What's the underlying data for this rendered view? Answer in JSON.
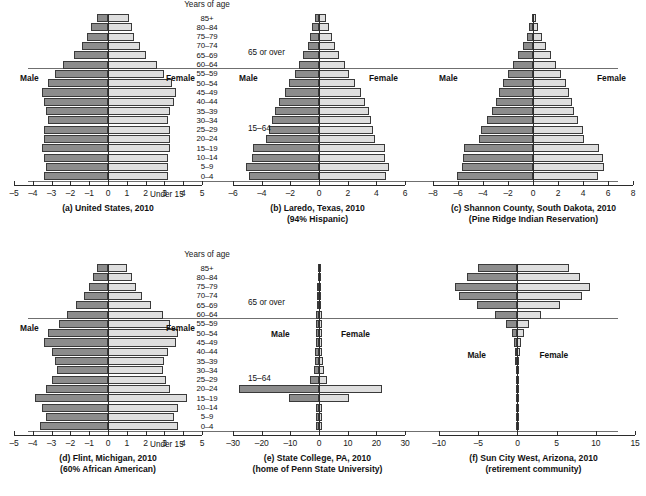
{
  "figure": {
    "age_axis_title": "Years of age",
    "age_groups": [
      "85+",
      "80–84",
      "75–79",
      "70–74",
      "65–69",
      "60–64",
      "55–59",
      "50–54",
      "45–49",
      "40–44",
      "35–39",
      "30–34",
      "25–29",
      "20–24",
      "15–19",
      "10–14",
      "5–9",
      "0–4"
    ],
    "annotations": {
      "over65": "65 or over",
      "working": "15–64",
      "under15": "Under 15",
      "male": "Male",
      "female": "Female"
    },
    "colors": {
      "male_bar": "#8c8c8c",
      "female_bar": "#dedede",
      "outline": "#3a3a3a",
      "rule": "#6f6f6f",
      "text": "#111111"
    }
  },
  "chart_data": [
    {
      "type": "bar",
      "id": "a",
      "title": "(a) United States, 2010",
      "subtitle": "",
      "xlabel": "",
      "ylabel": "Years of age",
      "xlim": [
        -5,
        5
      ],
      "xticks": [
        -5,
        -4,
        -3,
        -2,
        -1,
        0,
        1,
        2,
        3,
        4,
        5
      ],
      "xticklabels": [
        "–5",
        "–4",
        "–3",
        "–2",
        "–1",
        "0",
        "1",
        "2",
        "3",
        "4",
        "5"
      ],
      "categories": [
        "85+",
        "80–84",
        "75–79",
        "70–74",
        "65–69",
        "60–64",
        "55–59",
        "50–54",
        "45–49",
        "40–44",
        "35–39",
        "30–34",
        "25–29",
        "20–24",
        "15–19",
        "10–14",
        "5–9",
        "0–4"
      ],
      "series": [
        {
          "name": "Male",
          "values": [
            -0.6,
            -0.9,
            -1.1,
            -1.4,
            -1.8,
            -2.4,
            -2.8,
            -3.2,
            -3.5,
            -3.4,
            -3.3,
            -3.2,
            -3.4,
            -3.4,
            -3.5,
            -3.4,
            -3.3,
            -3.4
          ]
        },
        {
          "name": "Female",
          "values": [
            1.1,
            1.3,
            1.4,
            1.7,
            2.0,
            2.6,
            3.0,
            3.4,
            3.6,
            3.5,
            3.3,
            3.2,
            3.3,
            3.3,
            3.3,
            3.2,
            3.2,
            3.2
          ]
        }
      ],
      "grid": false,
      "legend": "none"
    },
    {
      "type": "bar",
      "id": "b",
      "title": "(b) Laredo, Texas, 2010",
      "subtitle": "(94% Hispanic)",
      "xlabel": "",
      "ylabel": "Years of age",
      "xlim": [
        -6,
        6
      ],
      "xticks": [
        -6,
        -4,
        -2,
        0,
        2,
        4,
        6
      ],
      "xticklabels": [
        "–6",
        "–4",
        "–2",
        "0",
        "2",
        "4",
        "6"
      ],
      "categories": [
        "85+",
        "80–84",
        "75–79",
        "70–74",
        "65–69",
        "60–64",
        "55–59",
        "50–54",
        "45–49",
        "40–44",
        "35–39",
        "30–34",
        "25–29",
        "20–24",
        "15–19",
        "10–14",
        "5–9",
        "0–4"
      ],
      "series": [
        {
          "name": "Male",
          "values": [
            -0.3,
            -0.5,
            -0.6,
            -0.8,
            -1.1,
            -1.4,
            -1.7,
            -2.1,
            -2.4,
            -2.8,
            -3.1,
            -3.3,
            -3.5,
            -3.7,
            -4.6,
            -4.7,
            -5.1,
            -4.9
          ]
        },
        {
          "name": "Female",
          "values": [
            0.5,
            0.7,
            0.9,
            1.1,
            1.4,
            1.8,
            2.1,
            2.5,
            2.9,
            3.2,
            3.5,
            3.6,
            3.8,
            3.9,
            4.6,
            4.6,
            4.9,
            4.7
          ]
        }
      ],
      "grid": false,
      "legend": "none"
    },
    {
      "type": "bar",
      "id": "c",
      "title": "(c) Shannon County, South Dakota, 2010",
      "subtitle": "(Pine Ridge Indian Reservation)",
      "xlabel": "",
      "ylabel": "Years of age",
      "xlim": [
        -8,
        8
      ],
      "xticks": [
        -8,
        -6,
        -4,
        -2,
        0,
        2,
        4,
        6,
        8
      ],
      "xticklabels": [
        "–8",
        "–6",
        "–4",
        "–2",
        "0",
        "2",
        "4",
        "6",
        "8"
      ],
      "categories": [
        "85+",
        "80–84",
        "75–79",
        "70–74",
        "65–69",
        "60–64",
        "55–59",
        "50–54",
        "45–49",
        "40–44",
        "35–39",
        "30–34",
        "25–29",
        "20–24",
        "15–19",
        "10–14",
        "5–9",
        "0–4"
      ],
      "series": [
        {
          "name": "Male",
          "values": [
            -0.1,
            -0.3,
            -0.5,
            -0.8,
            -1.2,
            -1.6,
            -2.0,
            -2.4,
            -2.7,
            -3.0,
            -3.3,
            -3.7,
            -4.2,
            -4.3,
            -5.5,
            -5.6,
            -5.7,
            -6.1
          ]
        },
        {
          "name": "Female",
          "values": [
            0.2,
            0.4,
            0.7,
            1.0,
            1.4,
            1.8,
            2.2,
            2.6,
            2.9,
            3.1,
            3.3,
            3.6,
            4.0,
            4.1,
            5.3,
            5.6,
            5.7,
            5.2
          ]
        }
      ],
      "grid": false,
      "legend": "none"
    },
    {
      "type": "bar",
      "id": "d",
      "title": "(d) Flint, Michigan, 2010",
      "subtitle": "(60% African American)",
      "xlabel": "",
      "ylabel": "Years of age",
      "xlim": [
        -5,
        5
      ],
      "xticks": [
        -5,
        -4,
        -3,
        -2,
        -1,
        0,
        1,
        2,
        3,
        4,
        5
      ],
      "xticklabels": [
        "–5",
        "–4",
        "–3",
        "–2",
        "–1",
        "0",
        "1",
        "2",
        "3",
        "4",
        "5"
      ],
      "categories": [
        "85+",
        "80–84",
        "75–79",
        "70–74",
        "65–69",
        "60–64",
        "55–59",
        "50–54",
        "45–49",
        "40–44",
        "35–39",
        "30–34",
        "25–29",
        "20–24",
        "15–19",
        "10–14",
        "5–9",
        "0–4"
      ],
      "series": [
        {
          "name": "Male",
          "values": [
            -0.6,
            -0.8,
            -1.0,
            -1.3,
            -1.7,
            -2.2,
            -2.6,
            -3.2,
            -3.4,
            -3.0,
            -2.8,
            -2.7,
            -3.0,
            -3.3,
            -3.9,
            -3.5,
            -3.3,
            -3.6
          ]
        },
        {
          "name": "Female",
          "values": [
            1.0,
            1.3,
            1.5,
            1.8,
            2.3,
            2.9,
            3.3,
            3.7,
            3.6,
            3.2,
            3.0,
            2.9,
            3.1,
            3.3,
            4.2,
            3.7,
            3.5,
            3.7
          ]
        }
      ],
      "grid": false,
      "legend": "none"
    },
    {
      "type": "bar",
      "id": "e",
      "title": "(e) State College, PA, 2010",
      "subtitle": "(home of Penn State University)",
      "xlabel": "",
      "ylabel": "Years of age",
      "xlim": [
        -30,
        30
      ],
      "xticks": [
        -30,
        -20,
        -10,
        0,
        10,
        20,
        30
      ],
      "xticklabels": [
        "–30",
        "–20",
        "–10",
        "0",
        "10",
        "20",
        "30"
      ],
      "categories": [
        "85+",
        "80–84",
        "75–79",
        "70–74",
        "65–69",
        "60–64",
        "55–59",
        "50–54",
        "45–49",
        "40–44",
        "35–39",
        "30–34",
        "25–29",
        "20–24",
        "15–19",
        "10–14",
        "5–9",
        "0–4"
      ],
      "series": [
        {
          "name": "Male",
          "values": [
            -0.5,
            -0.5,
            -0.6,
            -0.7,
            -0.7,
            -0.9,
            -1.0,
            -1.2,
            -1.2,
            -1.3,
            -1.5,
            -1.8,
            -3.3,
            -28.0,
            -10.5,
            -1.0,
            -1.0,
            -1.2
          ]
        },
        {
          "name": "Female",
          "values": [
            0.8,
            0.7,
            0.7,
            0.7,
            0.8,
            0.9,
            1.0,
            1.1,
            1.1,
            1.2,
            1.3,
            1.6,
            2.8,
            22.0,
            10.5,
            0.9,
            0.9,
            1.1
          ]
        }
      ],
      "grid": false,
      "legend": "none"
    },
    {
      "type": "bar",
      "id": "f",
      "title": "(f) Sun City West, Arizona, 2010",
      "subtitle": "(retirement community)",
      "xlabel": "",
      "ylabel": "Years of age",
      "xlim": [
        -10,
        15
      ],
      "xticks": [
        -10,
        -5,
        0,
        5,
        10,
        15
      ],
      "xticklabels": [
        "–10",
        "–5",
        "0",
        "5",
        "10",
        "15"
      ],
      "categories": [
        "85+",
        "80–84",
        "75–79",
        "70–74",
        "65–69",
        "60–64",
        "55–59",
        "50–54",
        "45–49",
        "40–44",
        "35–39",
        "30–34",
        "25–29",
        "20–24",
        "15–19",
        "10–14",
        "5–9",
        "0–4"
      ],
      "series": [
        {
          "name": "Male",
          "values": [
            -5.0,
            -6.4,
            -8.0,
            -7.4,
            -5.2,
            -2.8,
            -1.4,
            -0.7,
            -0.4,
            -0.3,
            -0.25,
            -0.2,
            -0.18,
            -0.15,
            -0.15,
            -0.15,
            -0.12,
            -0.12
          ]
        },
        {
          "name": "Female",
          "values": [
            6.6,
            8.0,
            9.2,
            8.2,
            5.4,
            3.0,
            1.5,
            0.8,
            0.45,
            0.3,
            0.25,
            0.2,
            0.18,
            0.15,
            0.15,
            0.15,
            0.12,
            0.12
          ]
        }
      ],
      "grid": false,
      "legend": "none"
    }
  ]
}
